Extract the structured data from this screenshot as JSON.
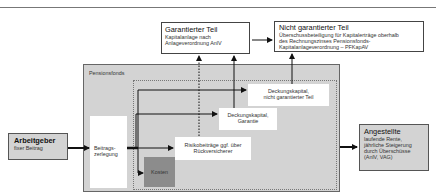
{
  "diagram": {
    "garantiert": {
      "title": "Garantierter Teil",
      "line1": "Kapitalanlage nach",
      "line2": "Anlageverordnung AnlV"
    },
    "nicht_garantiert": {
      "title": "Nicht garantierter Teil",
      "line1": "Überschussbeteiligung für Kapitalerträge oberhalb",
      "line2": "des Rechnungszinses Pensionsfonds-",
      "line3": "Kapitalanlageverordnung – PFKapAV"
    },
    "pensionsfonds": {
      "label": "Pensionsfonds"
    },
    "arbeitgeber": {
      "title": "Arbeitgeber",
      "sub": "fixer Beitrag"
    },
    "beitragszerlegung": {
      "line1": "Beitrags-",
      "line2": "zerlegung"
    },
    "deckung_nicht_garantiert": {
      "line1": "Deckungskapital,",
      "line2": "nicht garantierter Teil"
    },
    "deckung_garantie": {
      "line1": "Deckungskapital,",
      "line2": "Garantie"
    },
    "risiko": {
      "line1": "Risikobeiträge ggf. über",
      "line2": "Rückversicherer"
    },
    "kosten": {
      "label": "Kosten"
    },
    "angestellte": {
      "title": "Angestellte",
      "line1": "laufende Rente,",
      "line2": "jährliche Steigerung",
      "line3": "durch Überschüsse",
      "line4": "(AnlV, VAG)"
    },
    "colors": {
      "gray_box": "#d3d3d3",
      "kosten": "#8c8c8c",
      "line": "#111111"
    }
  }
}
